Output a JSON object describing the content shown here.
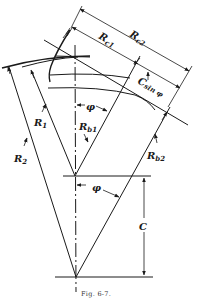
{
  "figure": {
    "caption": "Fig. 6-7.",
    "labels": {
      "rc2": {
        "main": "R",
        "sub": "c2"
      },
      "rc1": {
        "main": "R",
        "sub": "c1"
      },
      "csinphi": {
        "main": "C",
        "sub": "sin φ"
      },
      "r1": {
        "main": "R",
        "sub": "1"
      },
      "r2": {
        "main": "R",
        "sub": "2"
      },
      "rb1": {
        "main": "R",
        "sub": "b1"
      },
      "rb2": {
        "main": "R",
        "sub": "b2"
      },
      "phi_top": "φ",
      "phi_bottom": "φ",
      "c": "C"
    }
  }
}
